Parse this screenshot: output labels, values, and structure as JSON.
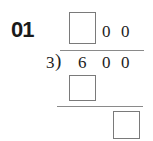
{
  "problem": {
    "number": "01",
    "divisor": "3",
    "divisor_bracket": ")",
    "dividend": [
      "6",
      "0",
      "0"
    ],
    "quotient": {
      "blank": "",
      "digits": [
        "0",
        "0"
      ]
    },
    "work": {
      "first_product_blank": "",
      "remainder_blank": ""
    }
  },
  "colors": {
    "text": "#222222",
    "box_border": "#7a7a7a",
    "line": "#8a8a8a"
  }
}
